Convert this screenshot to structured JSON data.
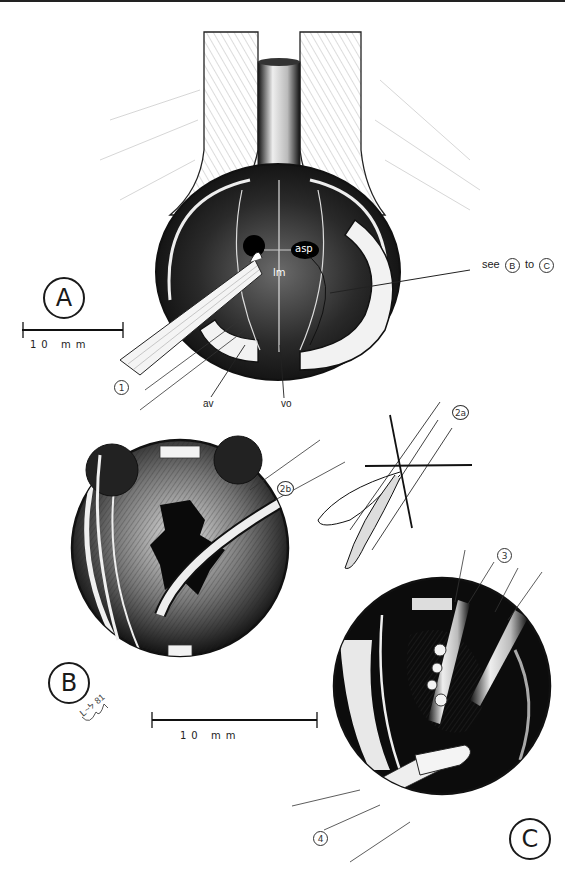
{
  "figure": {
    "panels": [
      {
        "id": "A",
        "label": "A"
      },
      {
        "id": "B",
        "label": "B"
      },
      {
        "id": "C",
        "label": "C"
      }
    ],
    "annotations_panel_a": {
      "asp": "asp",
      "lm": "lm",
      "av": "av",
      "vo": "vo",
      "see_prefix": "see",
      "see_from": "B",
      "see_to_word": "to",
      "see_to": "C",
      "instrument_1": "1"
    },
    "annotations_panel_b": {
      "instrument_2a": "2a",
      "instrument_2b": "2b",
      "signature": "ᒪ~ᔭ 81"
    },
    "annotations_panel_c": {
      "instrument_3": "3",
      "instrument_4": "4"
    },
    "scale_bars": [
      {
        "panel": "A",
        "text": "10 mm"
      },
      {
        "panel": "B-C",
        "text": "10 mm"
      }
    ]
  }
}
